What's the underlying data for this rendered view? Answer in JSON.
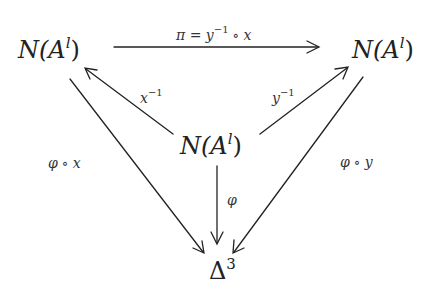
{
  "diagram": {
    "type": "commutative-diagram",
    "nodes": {
      "top_left": {
        "base": "N(A",
        "sup": "l",
        "close": ")"
      },
      "top_right": {
        "base": "N(A",
        "sup": "l",
        "close": ")"
      },
      "center": {
        "base": "N(A",
        "sup": "l",
        "close": ")"
      },
      "bottom": {
        "base": "Δ",
        "sup": "3"
      }
    },
    "arrows": {
      "top": {
        "from": "top_left",
        "to": "top_right",
        "label_pre": "π = y",
        "label_sup": "−1",
        "label_op": "∘",
        "label_post": "x"
      },
      "center_to_left": {
        "from": "center",
        "to": "top_left",
        "label": "x",
        "label_sup": "−1"
      },
      "center_to_right": {
        "from": "center",
        "to": "top_right",
        "label": "y",
        "label_sup": "−1"
      },
      "left_to_bottom": {
        "from": "top_left",
        "to": "bottom",
        "label_pre": "φ",
        "label_op": "∘",
        "label_post": "x"
      },
      "right_to_bottom": {
        "from": "top_right",
        "to": "bottom",
        "label_pre": "φ",
        "label_op": "∘",
        "label_post": "y"
      },
      "center_to_bottom": {
        "from": "center",
        "to": "bottom",
        "label": "φ"
      }
    },
    "stroke_color": "#222222"
  }
}
